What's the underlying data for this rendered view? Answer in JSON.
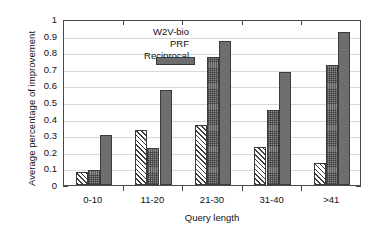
{
  "chart_data": {
    "type": "bar",
    "title": "",
    "xlabel": "Query length",
    "ylabel": "Average percentage of improvement",
    "categories": [
      "0-10",
      "11-20",
      "21-30",
      "31-40",
      ">41"
    ],
    "series": [
      {
        "name": "W2V-bio",
        "values": [
          0.08,
          0.33,
          0.36,
          0.23,
          0.13
        ],
        "pattern": "diagonal-hatch"
      },
      {
        "name": "PRF",
        "values": [
          0.09,
          0.22,
          0.77,
          0.45,
          0.72
        ],
        "pattern": "dense-crosshatch"
      },
      {
        "name": "Reciprocal",
        "values": [
          0.3,
          0.57,
          0.87,
          0.68,
          0.92
        ],
        "pattern": "solid-dark-grey"
      }
    ],
    "ylim": [
      0,
      1
    ],
    "ytick_labels": [
      "0",
      "0.1",
      "0.2",
      "0.3",
      "0.4",
      "0.5",
      "0.6",
      "0.7",
      "0.8",
      "0.9",
      "1"
    ],
    "ytick_values": [
      0,
      0.1,
      0.2,
      0.3,
      0.4,
      0.5,
      0.6,
      0.7,
      0.8,
      0.9,
      1
    ],
    "grid": true,
    "legend_position": "top-left-inside",
    "colors": {
      "series_w2v_bio": "#ffffff",
      "series_prf": "#8d8d8d",
      "series_reciprocal": "#6e6e6e",
      "axis": "#4a4a4a",
      "grid": "#d8d8d8",
      "background": "#ffffff"
    }
  }
}
